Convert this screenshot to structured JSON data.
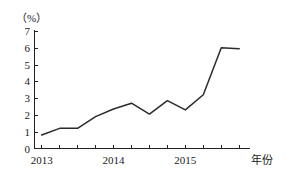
{
  "chart_data": {
    "type": "line",
    "title": "",
    "subtitle": "",
    "xlabel": "年份",
    "ylabel": "（%）",
    "ylim": [
      0,
      7
    ],
    "yticks": [
      0,
      1,
      2,
      3,
      4,
      5,
      6,
      7
    ],
    "ytick_labels": [
      "0",
      "1",
      "2",
      "3",
      "4",
      "5",
      "6",
      "7"
    ],
    "xtick_labels": [
      "2013",
      "2014",
      "2015"
    ],
    "xtick_positions": [
      0,
      4,
      8
    ],
    "xlim": [
      -0.4,
      11.6
    ],
    "minor_xticks": [
      0,
      1,
      2,
      3,
      4,
      5,
      6,
      7,
      8,
      9,
      10,
      11
    ],
    "grid": false,
    "legend": false,
    "markers": false,
    "line_color": "#2b2b2b",
    "axis_color": "#222222",
    "background": "#ffffff",
    "series": [
      {
        "name": "增长率",
        "x": [
          0,
          1,
          2,
          3,
          4,
          5,
          6,
          7,
          8,
          9,
          10,
          11
        ],
        "values": [
          0.8,
          1.2,
          1.2,
          1.9,
          2.35,
          2.7,
          2.05,
          2.85,
          2.3,
          3.2,
          6.0,
          5.95
        ]
      }
    ],
    "annotations": []
  },
  "axis": {
    "y_unit_label": "（%）",
    "x_axis_name": "年份"
  }
}
